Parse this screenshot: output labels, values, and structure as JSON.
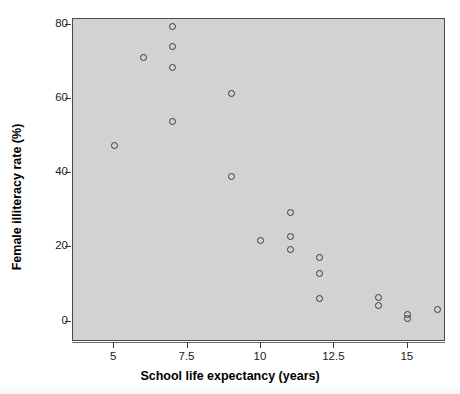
{
  "chart_data": {
    "type": "scatter",
    "title": "",
    "xlabel": "School life expectancy (years)",
    "ylabel": "Female illiteracy rate (%)",
    "xlim": [
      3.6,
      16.3
    ],
    "ylim": [
      -5.5,
      81.5
    ],
    "xticks": [
      5,
      7.5,
      10,
      12.5,
      15
    ],
    "xtick_labels": [
      "5",
      "7.5",
      "10",
      "12.5",
      "15"
    ],
    "yticks": [
      0,
      20,
      40,
      60,
      80
    ],
    "ytick_labels": [
      "0",
      "20",
      "40",
      "60",
      "80"
    ],
    "grid": false,
    "legend": null,
    "marker": "open-circle",
    "panel_color": "#d2d2d2",
    "marker_color": "#3a3a3a",
    "points": [
      {
        "x": 7.0,
        "y": 79.5
      },
      {
        "x": 7.0,
        "y": 74.0
      },
      {
        "x": 6.0,
        "y": 71.2
      },
      {
        "x": 7.0,
        "y": 68.5
      },
      {
        "x": 9.0,
        "y": 61.5
      },
      {
        "x": 7.0,
        "y": 54.0
      },
      {
        "x": 5.0,
        "y": 47.5
      },
      {
        "x": 9.0,
        "y": 39.0
      },
      {
        "x": 11.0,
        "y": 29.5
      },
      {
        "x": 10.0,
        "y": 21.8
      },
      {
        "x": 11.0,
        "y": 22.8
      },
      {
        "x": 11.0,
        "y": 19.3
      },
      {
        "x": 12.0,
        "y": 17.3
      },
      {
        "x": 12.0,
        "y": 13.0
      },
      {
        "x": 12.0,
        "y": 6.2
      },
      {
        "x": 14.0,
        "y": 6.5
      },
      {
        "x": 14.0,
        "y": 4.3
      },
      {
        "x": 15.0,
        "y": 2.0
      },
      {
        "x": 15.0,
        "y": 0.8
      },
      {
        "x": 16.0,
        "y": 3.2
      }
    ]
  }
}
